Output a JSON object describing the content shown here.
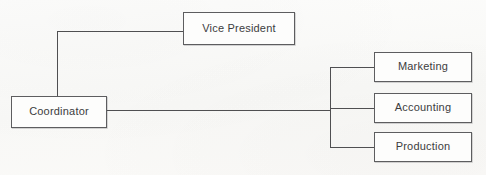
{
  "diagram": {
    "type": "org-chart",
    "background_color": "#fbfbf9",
    "line_color": "#4f4f51",
    "box_border_color": "#5d5d5f",
    "box_fill_color": "#fdfdfc",
    "text_color": "#3c3c3e",
    "nodes": [
      {
        "id": "vice-president",
        "label": "Vice President",
        "x": 183,
        "y": 12,
        "width": 112,
        "height": 33
      },
      {
        "id": "coordinator",
        "label": "Coordinator",
        "x": 11,
        "y": 96,
        "width": 96,
        "height": 32
      },
      {
        "id": "marketing",
        "label": "Marketing",
        "x": 374,
        "y": 52,
        "width": 98,
        "height": 30
      },
      {
        "id": "accounting",
        "label": "Accounting",
        "x": 374,
        "y": 93,
        "width": 98,
        "height": 30
      },
      {
        "id": "production",
        "label": "Production",
        "x": 374,
        "y": 132,
        "width": 98,
        "height": 30
      }
    ],
    "connections": [
      {
        "from": "coordinator",
        "to": "vice-president"
      },
      {
        "from": "coordinator",
        "to": "marketing"
      },
      {
        "from": "coordinator",
        "to": "accounting"
      },
      {
        "from": "coordinator",
        "to": "production"
      }
    ]
  }
}
